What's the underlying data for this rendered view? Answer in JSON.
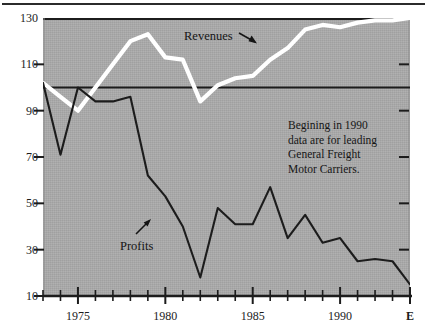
{
  "chart_data": {
    "type": "line",
    "title": "",
    "subtitle": "",
    "xlabel": "",
    "ylabel": "",
    "xlim": [
      1973,
      1994
    ],
    "ylim": [
      10,
      130
    ],
    "grid": false,
    "legend_position": "inline-annotations",
    "y_ticks": [
      130,
      110,
      90,
      70,
      50,
      30,
      10
    ],
    "y_tick_labels": [
      "130",
      "110",
      "90",
      "70",
      "50",
      "30",
      "10"
    ],
    "x_ticks": [
      1973,
      1974,
      1975,
      1976,
      1977,
      1978,
      1979,
      1980,
      1981,
      1982,
      1983,
      1984,
      1985,
      1986,
      1987,
      1988,
      1989,
      1990,
      1991,
      1992,
      1993,
      1994
    ],
    "x_tick_labels": [
      "",
      "",
      "1975",
      "",
      "",
      "",
      "",
      "1980",
      "",
      "",
      "",
      "",
      "1985",
      "",
      "",
      "",
      "",
      "1990",
      "",
      "",
      "",
      "E"
    ],
    "x_labeled_ticks": [
      "1975",
      "1980",
      "1985",
      "1990",
      "E"
    ],
    "reference_line": {
      "value": 100,
      "orientation": "horizontal",
      "color": "#1c1c1c"
    },
    "series": [
      {
        "name": "Revenues",
        "color": "#ffffff",
        "style": "thick-white-line",
        "x": [
          1973,
          1974,
          1975,
          1976,
          1977,
          1978,
          1979,
          1980,
          1981,
          1982,
          1983,
          1984,
          1985,
          1986,
          1987,
          1988,
          1989,
          1990,
          1991,
          1992,
          1993,
          1994
        ],
        "values": [
          102,
          96,
          90,
          100,
          110,
          120,
          123,
          113,
          112,
          94,
          101,
          104,
          105,
          112,
          117,
          125,
          127,
          126,
          128,
          129,
          129,
          130
        ]
      },
      {
        "name": "Profits",
        "color": "#1c1c1c",
        "style": "thin-black-line",
        "x": [
          1973,
          1974,
          1975,
          1976,
          1977,
          1978,
          1979,
          1980,
          1981,
          1982,
          1983,
          1984,
          1985,
          1986,
          1987,
          1988,
          1989,
          1990,
          1991,
          1992,
          1993,
          1994
        ],
        "values": [
          102,
          71,
          100,
          94,
          94,
          96,
          62,
          53,
          40,
          18,
          48,
          41,
          41,
          57,
          35,
          45,
          33,
          35,
          25,
          26,
          25,
          15
        ]
      }
    ],
    "annotations": [
      {
        "name": "revenues-label",
        "text": "Revenues",
        "x_px": 184,
        "y_px": 30,
        "arrow": "down-right"
      },
      {
        "name": "profits-label",
        "text": "Profits",
        "x_px": 120,
        "y_px": 240,
        "arrow": "up-right"
      }
    ],
    "note": {
      "lines": [
        "Begining in 1990",
        "data are for leading",
        "General Freight",
        "Motor Carriers."
      ]
    },
    "colors": {
      "panel_background": "#ababab",
      "figure_background": "#ffffff",
      "axis": "#1c1c1c",
      "revenues": "#ffffff",
      "profits": "#1c1c1c"
    }
  }
}
